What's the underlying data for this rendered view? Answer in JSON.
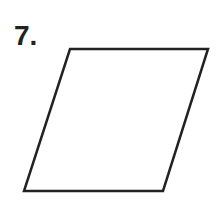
{
  "problem": {
    "number_label": "7.",
    "shape": "parallelogram",
    "vertices": [
      [
        70,
        49
      ],
      [
        208,
        49
      ],
      [
        163,
        191
      ],
      [
        24,
        191
      ]
    ],
    "stroke_color": "#222222",
    "stroke_width": 2.5
  }
}
